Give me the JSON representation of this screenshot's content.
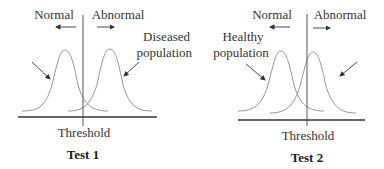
{
  "panels": [
    {
      "id": "test1",
      "title": "Test 1",
      "threshold_label": "Threshold",
      "left_label": "Normal",
      "right_label": "Abnormal",
      "annotation_line1": "Diseased",
      "annotation_line2": "population"
    },
    {
      "id": "test2",
      "title": "Test 2",
      "threshold_label": "Threshold",
      "left_label": "Normal",
      "right_label": "Abnormal",
      "annotation_line1": "Healthy",
      "annotation_line2": "population"
    }
  ],
  "colors": {
    "curve": "#8a8a8a",
    "axis": "#333333",
    "text": "#333333"
  }
}
